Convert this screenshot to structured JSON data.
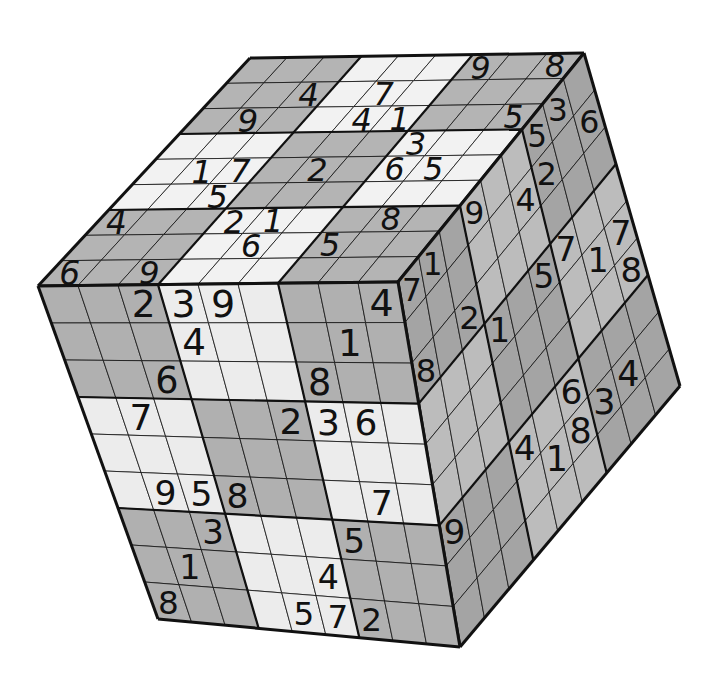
{
  "colors": {
    "background": "#ffffff",
    "light": "#ececec",
    "dark": "#b0b0b0",
    "top_light": "#f2f2f2",
    "top_dark": "#b4b4b4",
    "right_light": "#bcbcbc",
    "right_dark": "#a4a4a4",
    "line": "#111111",
    "digit": "#111111"
  },
  "geometry": {
    "front": {
      "tl": [
        38,
        286
      ],
      "tr": [
        398,
        282
      ],
      "br": [
        460,
        647
      ],
      "bl": [
        158,
        619
      ]
    },
    "top": {
      "bl": [
        38,
        286
      ],
      "br": [
        398,
        282
      ],
      "tr": [
        584,
        53
      ],
      "tl": [
        250,
        58
      ]
    },
    "right": {
      "tl": [
        398,
        282
      ],
      "tr": [
        584,
        53
      ],
      "br": [
        680,
        386
      ],
      "bl": [
        460,
        647
      ]
    }
  },
  "faces": {
    "top": {
      "name": "top-face",
      "grid": [
        [
          "",
          "",
          "",
          "",
          "",
          "",
          "9",
          "",
          "8"
        ],
        [
          "",
          "",
          "4",
          "",
          "7",
          "",
          "",
          "",
          ""
        ],
        [
          "",
          "9",
          "",
          "",
          "4",
          "1",
          "",
          "",
          "5"
        ],
        [
          "",
          "",
          "",
          "",
          "",
          "",
          "3",
          "",
          ""
        ],
        [
          "",
          "1",
          "7",
          "",
          "2",
          "",
          "6",
          "5",
          ""
        ],
        [
          "",
          "",
          "5",
          "",
          "",
          "",
          "",
          "",
          ""
        ],
        [
          "4",
          "",
          "",
          "2",
          "1",
          "",
          "",
          "8",
          ""
        ],
        [
          "",
          "",
          "",
          "",
          "6",
          "",
          "5",
          "",
          ""
        ],
        [
          "6",
          "",
          "9",
          "",
          "",
          "",
          "",
          "",
          ""
        ]
      ]
    },
    "front": {
      "name": "front-face",
      "grid": [
        [
          "",
          "",
          "2",
          "3",
          "9",
          "",
          "",
          "",
          "4"
        ],
        [
          "",
          "",
          "",
          "4",
          "",
          "",
          "",
          "1",
          ""
        ],
        [
          "",
          "",
          "6",
          "",
          "",
          "",
          "8",
          "",
          ""
        ],
        [
          "",
          "7",
          "",
          "",
          "",
          "2",
          "3",
          "6",
          ""
        ],
        [
          "",
          "",
          "",
          "",
          "",
          "",
          "",
          "",
          ""
        ],
        [
          "",
          "9",
          "5",
          "8",
          "",
          "",
          "",
          "7",
          ""
        ],
        [
          "",
          "",
          "3",
          "",
          "",
          "",
          "5",
          "",
          ""
        ],
        [
          "",
          "1",
          "",
          "",
          "",
          "4",
          "",
          "",
          ""
        ],
        [
          "8",
          "",
          "",
          "",
          "5",
          "7",
          "2",
          "",
          ""
        ]
      ]
    },
    "right": {
      "name": "right-face",
      "grid": [
        [
          "7",
          "1",
          "",
          "9",
          "",
          "",
          "5",
          "3",
          ""
        ],
        [
          "",
          "",
          "",
          "",
          "",
          "4",
          "2",
          "",
          "6"
        ],
        [
          "8",
          "",
          "2",
          "",
          "",
          "",
          "",
          "",
          ""
        ],
        [
          "",
          "",
          "",
          "1",
          "",
          "5",
          "7",
          "",
          ""
        ],
        [
          "",
          "",
          "",
          "",
          "",
          "",
          "",
          "1",
          "7"
        ],
        [
          "",
          "",
          "",
          "",
          "",
          "",
          "",
          "",
          "8"
        ],
        [
          "9",
          "",
          "",
          "4",
          "",
          "6",
          "",
          "",
          ""
        ],
        [
          "",
          "",
          "",
          "",
          "1",
          "8",
          "3",
          "4",
          ""
        ],
        [
          "",
          "",
          "",
          "",
          "",
          "",
          "",
          "",
          ""
        ]
      ]
    }
  }
}
